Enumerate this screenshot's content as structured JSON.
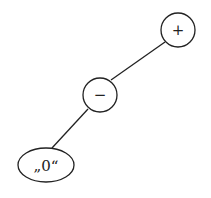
{
  "diagram": {
    "type": "tree",
    "nodes": [
      {
        "id": "root",
        "label": "+",
        "shape": "circle",
        "cx": 178,
        "cy": 30,
        "r": 17
      },
      {
        "id": "minus",
        "label": "−",
        "shape": "circle",
        "cx": 100,
        "cy": 95,
        "r": 17
      },
      {
        "id": "zero",
        "label": "„0“",
        "shape": "ellipse",
        "cx": 46,
        "cy": 165,
        "rx": 28,
        "ry": 17
      }
    ],
    "edges": [
      {
        "from": "root",
        "to": "minus"
      },
      {
        "from": "minus",
        "to": "zero"
      }
    ],
    "colors": {
      "stroke": "#222222",
      "background": "#ffffff"
    }
  }
}
